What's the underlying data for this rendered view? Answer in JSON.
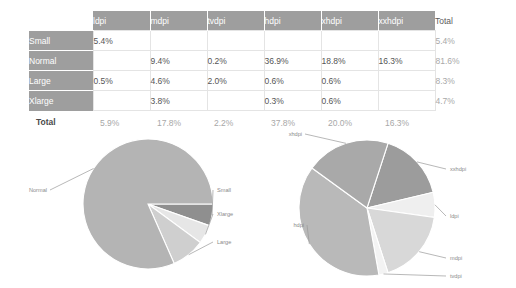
{
  "table": {
    "corner_label": "",
    "columns": [
      "ldpi",
      "mdpi",
      "tvdpi",
      "hdpi",
      "xhdpi",
      "xxhdpi"
    ],
    "total_header": "Total",
    "total_row_label": "Total",
    "rows": [
      {
        "label": "Small",
        "values": [
          "5.4%",
          "",
          "",
          "",
          "",
          ""
        ],
        "total": "5.4%"
      },
      {
        "label": "Normal",
        "values": [
          "",
          "9.4%",
          "0.2%",
          "36.9%",
          "18.8%",
          "16.3%"
        ],
        "total": "81.6%"
      },
      {
        "label": "Large",
        "values": [
          "0.5%",
          "4.6%",
          "2.0%",
          "0.6%",
          "0.6%",
          ""
        ],
        "total": "8.3%"
      },
      {
        "label": "Xlarge",
        "values": [
          "",
          "3.8%",
          "",
          "0.3%",
          "0.6%",
          ""
        ],
        "total": "4.7%"
      }
    ],
    "totals": [
      "5.9%",
      "17.8%",
      "2.2%",
      "37.8%",
      "20.0%",
      "16.3%"
    ]
  },
  "chart_data": [
    {
      "type": "pie",
      "title": "Screen size distribution",
      "labels": [
        "Normal",
        "Small",
        "Xlarge",
        "Large"
      ],
      "values": [
        81.6,
        5.4,
        4.7,
        8.3
      ],
      "unit": "%",
      "colors": [
        "#b4b4b4",
        "#8f8f8f",
        "#e6e6e6",
        "#cfcfcf"
      ],
      "legend": "leader-lines",
      "label_positions": [
        {
          "label": "Normal",
          "side": "left"
        },
        {
          "label": "Small",
          "side": "right"
        },
        {
          "label": "Xlarge",
          "side": "right"
        },
        {
          "label": "Large",
          "side": "right"
        }
      ]
    },
    {
      "type": "pie",
      "title": "Screen density distribution",
      "labels": [
        "xxhdpi",
        "ldpi",
        "mdpi",
        "tvdpi",
        "hdpi",
        "xhdpi"
      ],
      "values": [
        16.3,
        5.9,
        17.8,
        2.2,
        37.8,
        20.0
      ],
      "unit": "%",
      "colors": [
        "#9c9c9c",
        "#efefef",
        "#d8d8d8",
        "#f3f3f3",
        "#b9b9b9",
        "#a9a9a9"
      ],
      "legend": "leader-lines",
      "label_positions": [
        {
          "label": "xhdpi",
          "side": "top-left"
        },
        {
          "label": "xxhdpi",
          "side": "right"
        },
        {
          "label": "ldpi",
          "side": "right"
        },
        {
          "label": "mdpi",
          "side": "right"
        },
        {
          "label": "tvdpi",
          "side": "right"
        },
        {
          "label": "hdpi",
          "side": "left"
        }
      ]
    }
  ]
}
